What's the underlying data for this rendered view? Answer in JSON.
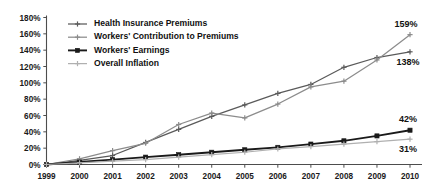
{
  "chart_data": {
    "type": "line",
    "title": "",
    "xlabel": "",
    "ylabel": "",
    "x": [
      1999,
      2000,
      2001,
      2002,
      2003,
      2004,
      2005,
      2006,
      2007,
      2008,
      2009,
      2010
    ],
    "xtick_labels": [
      "1999",
      "2000",
      "2001",
      "2002",
      "2003",
      "2004",
      "2005",
      "2006",
      "2007",
      "2008",
      "2009",
      "2010"
    ],
    "ytick_labels": [
      "0%",
      "20%",
      "40%",
      "60%",
      "80%",
      "100%",
      "120%",
      "140%",
      "160%",
      "180%"
    ],
    "ytick_values": [
      0,
      20,
      40,
      60,
      80,
      100,
      120,
      140,
      160,
      180
    ],
    "ylim": [
      0,
      180
    ],
    "grid": false,
    "legend_position": "upper-left-inside",
    "series": [
      {
        "name": "Health Insurance Premiums",
        "color": "#5a5a5a",
        "marker": "cross",
        "end_label": "138%",
        "values": [
          0,
          5,
          11,
          27,
          43,
          59,
          73,
          87,
          98,
          119,
          131,
          138
        ]
      },
      {
        "name": "Workers' Contribution to Premiums",
        "color": "#8c8c8c",
        "marker": "cross",
        "end_label": "159%",
        "values": [
          0,
          7,
          17,
          26,
          49,
          63,
          57,
          74,
          95,
          102,
          128,
          159
        ]
      },
      {
        "name": "Workers' Earnings",
        "color": "#1a1a1a",
        "marker": "square",
        "end_label": "42%",
        "values": [
          0,
          3,
          6,
          9,
          12,
          15,
          18,
          21,
          25,
          29,
          35,
          42
        ]
      },
      {
        "name": "Overall Inflation",
        "color": "#b0b0b0",
        "marker": "cross",
        "end_label": "31%",
        "values": [
          0,
          2,
          4,
          6,
          9,
          12,
          15,
          19,
          22,
          25,
          28,
          31
        ]
      }
    ]
  }
}
